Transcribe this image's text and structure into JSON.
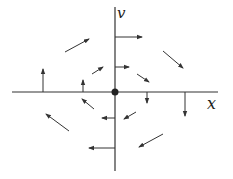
{
  "diagram": {
    "type": "phase-plane vector field",
    "axes": {
      "horizontal_label": "x",
      "vertical_label": "v",
      "origin": [
        115,
        92
      ],
      "horizontal": {
        "x1": 12,
        "y1": 92,
        "x2": 218,
        "y2": 92
      },
      "vertical": {
        "x1": 115,
        "y1": 7,
        "x2": 115,
        "y2": 171
      }
    },
    "colors": {
      "stroke": "#333333",
      "background": "#ffffff"
    },
    "origin_point": {
      "cx": 115,
      "cy": 92,
      "r": 3.5
    },
    "arrows": [
      {
        "x1": 115,
        "y1": 37,
        "x2": 142,
        "y2": 37
      },
      {
        "x1": 115,
        "y1": 67,
        "x2": 129,
        "y2": 67
      },
      {
        "x1": 65,
        "y1": 52,
        "x2": 89,
        "y2": 39
      },
      {
        "x1": 92,
        "y1": 74,
        "x2": 103,
        "y2": 67
      },
      {
        "x1": 43,
        "y1": 92,
        "x2": 43,
        "y2": 69
      },
      {
        "x1": 83,
        "y1": 92,
        "x2": 83,
        "y2": 80
      },
      {
        "x1": 163,
        "y1": 51,
        "x2": 183,
        "y2": 68
      },
      {
        "x1": 137,
        "y1": 74,
        "x2": 149,
        "y2": 82
      },
      {
        "x1": 147,
        "y1": 92,
        "x2": 147,
        "y2": 103
      },
      {
        "x1": 185,
        "y1": 92,
        "x2": 185,
        "y2": 116
      },
      {
        "x1": 94,
        "y1": 109,
        "x2": 82,
        "y2": 99
      },
      {
        "x1": 69,
        "y1": 131,
        "x2": 46,
        "y2": 114
      },
      {
        "x1": 115,
        "y1": 118,
        "x2": 102,
        "y2": 118
      },
      {
        "x1": 136,
        "y1": 112,
        "x2": 124,
        "y2": 119
      },
      {
        "x1": 115,
        "y1": 148,
        "x2": 89,
        "y2": 148
      },
      {
        "x1": 163,
        "y1": 134,
        "x2": 139,
        "y2": 147
      }
    ]
  }
}
